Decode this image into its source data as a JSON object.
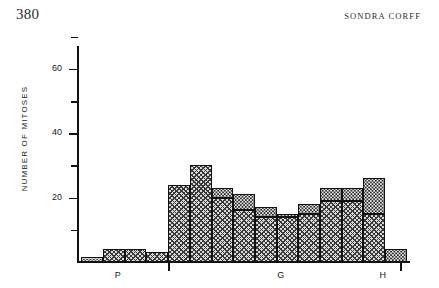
{
  "page": {
    "folio": "380",
    "running_head": "SONDRA  CORFF"
  },
  "chart_data": {
    "type": "bar",
    "title": "",
    "xlabel": "",
    "ylabel": "NUMBER OF MITOSES",
    "ylim": [
      0,
      72
    ],
    "grid": false,
    "legend": false,
    "stacked": true,
    "y_ticks_major": [
      20,
      40,
      60
    ],
    "y_ticks_minor": [
      10,
      30,
      50,
      70
    ],
    "y_tick_labels": [
      "20",
      "40",
      "60"
    ],
    "x_region_labels": [
      "P",
      "G",
      "H"
    ],
    "series": [
      {
        "name": "hatched",
        "values": [
          0,
          4,
          4,
          3,
          24,
          30,
          20,
          16,
          14,
          14,
          15,
          19,
          19,
          15,
          0
        ]
      },
      {
        "name": "stippled",
        "values": [
          1.5,
          0,
          0,
          0,
          0,
          0,
          3,
          5,
          3,
          1,
          3,
          4,
          4,
          11,
          4
        ]
      }
    ],
    "totals": [
      1.5,
      4,
      4,
      3,
      24,
      30,
      23,
      21,
      17,
      15,
      18,
      23,
      23,
      26,
      4
    ],
    "bars": [
      {
        "index": 1,
        "x": 81,
        "width": 22,
        "hatched": 0,
        "stippled": 1.5,
        "total": 1.5
      },
      {
        "index": 2,
        "x": 103,
        "width": 22,
        "hatched": 4,
        "stippled": 0,
        "total": 4
      },
      {
        "index": 3,
        "x": 125,
        "width": 21,
        "hatched": 4,
        "stippled": 0,
        "total": 4
      },
      {
        "index": 4,
        "x": 146,
        "width": 22,
        "hatched": 3,
        "stippled": 0,
        "total": 3
      },
      {
        "index": 5,
        "x": 168,
        "width": 22,
        "hatched": 24,
        "stippled": 0,
        "total": 24
      },
      {
        "index": 6,
        "x": 190,
        "width": 22,
        "hatched": 30,
        "stippled": 0,
        "total": 30
      },
      {
        "index": 7,
        "x": 212,
        "width": 21,
        "hatched": 20,
        "stippled": 3,
        "total": 23
      },
      {
        "index": 8,
        "x": 233,
        "width": 22,
        "hatched": 16,
        "stippled": 5,
        "total": 21
      },
      {
        "index": 9,
        "x": 255,
        "width": 22,
        "hatched": 14,
        "stippled": 3,
        "total": 17
      },
      {
        "index": 10,
        "x": 277,
        "width": 21,
        "hatched": 14,
        "stippled": 1,
        "total": 15
      },
      {
        "index": 11,
        "x": 298,
        "width": 22,
        "hatched": 15,
        "stippled": 3,
        "total": 18
      },
      {
        "index": 12,
        "x": 320,
        "width": 22,
        "hatched": 19,
        "stippled": 4,
        "total": 23
      },
      {
        "index": 13,
        "x": 342,
        "width": 21,
        "hatched": 19,
        "stippled": 4,
        "total": 23
      },
      {
        "index": 14,
        "x": 363,
        "width": 22,
        "hatched": 15,
        "stippled": 11,
        "total": 26
      },
      {
        "index": 15,
        "x": 385,
        "width": 22,
        "hatched": 0,
        "stippled": 4,
        "total": 4
      }
    ]
  }
}
